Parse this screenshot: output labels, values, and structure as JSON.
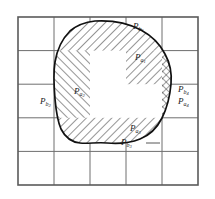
{
  "figure": {
    "grid": {
      "columns": 5,
      "rows": 5,
      "x0": 18,
      "y0": 17,
      "x1": 198,
      "y1": 185,
      "line_color": "#6e6e6e",
      "border_color": "#5a5a5a"
    },
    "blob": {
      "outline_color": "#111111",
      "fill_color": "#ffffff",
      "hatch_color": "#333333"
    },
    "labels": [
      {
        "id": "Pb1",
        "p": "P",
        "sub": "b",
        "subsub": "1",
        "x": 133,
        "y": 27,
        "leader": false
      },
      {
        "id": "Pa1",
        "p": "P",
        "sub": "a",
        "subsub": "1",
        "x": 135,
        "y": 58,
        "leader": false
      },
      {
        "id": "Pa2",
        "p": "P",
        "sub": "a",
        "subsub": "2",
        "x": 74,
        "y": 92,
        "leader": false
      },
      {
        "id": "Pb2",
        "p": "P",
        "sub": "b",
        "subsub": "2",
        "x": 40,
        "y": 102,
        "leader": false
      },
      {
        "id": "Pb4",
        "p": "P",
        "sub": "b",
        "subsub": "4",
        "x": 178,
        "y": 90,
        "leader": false
      },
      {
        "id": "Pa4",
        "p": "P",
        "sub": "a",
        "subsub": "4",
        "x": 178,
        "y": 102,
        "leader": false
      },
      {
        "id": "Pa3",
        "p": "P",
        "sub": "a",
        "subsub": "3",
        "x": 130,
        "y": 129,
        "leader": false
      },
      {
        "id": "Pb3",
        "p": "P",
        "sub": "b",
        "subsub": "3",
        "x": 121,
        "y": 145,
        "leader": true
      }
    ]
  }
}
